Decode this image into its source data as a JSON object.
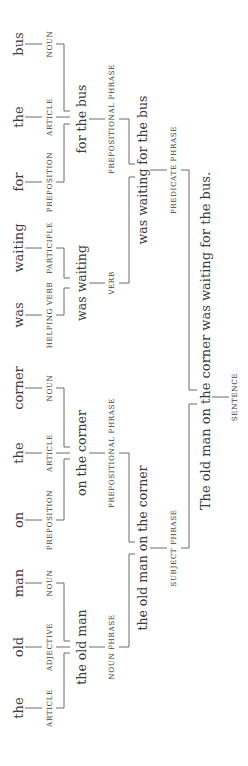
{
  "diagram": {
    "sentence": "The old man on the corner was waiting for the bus.",
    "words": [
      {
        "text": "bus",
        "pos": "NOUN"
      },
      {
        "text": "the",
        "pos": "ARTICLE"
      },
      {
        "text": "for",
        "pos": "PREPOSITION"
      },
      {
        "text": "waiting",
        "pos": "PARTICIPLE"
      },
      {
        "text": "was",
        "pos": "HELPING VERB"
      },
      {
        "text": "corner",
        "pos": "NOUN"
      },
      {
        "text": "the",
        "pos": "ARTICLE"
      },
      {
        "text": "on",
        "pos": "PREPOSITION"
      },
      {
        "text": "man",
        "pos": "NOUN"
      },
      {
        "text": "old",
        "pos": "ADJECTIVE"
      },
      {
        "text": "the",
        "pos": "ARTICLE"
      }
    ],
    "level2": [
      {
        "text": "for the bus",
        "label": "PREPOSITIONAL PHRASE"
      },
      {
        "text": "was waiting",
        "label": "VERB"
      },
      {
        "text": "on the corner",
        "label": "PREPOSITIONAL PHRASE"
      },
      {
        "text": "the old man",
        "label": "NOUN PHRASE"
      }
    ],
    "level3": [
      {
        "text": "was waiting for the bus",
        "label": "PREDICATE PHRASE"
      },
      {
        "text": "the old man on the corner",
        "label": "SUBJECT PHRASE"
      }
    ],
    "root": {
      "text": "The old man on the corner was waiting for the bus.",
      "label": "SENTENCE"
    }
  }
}
